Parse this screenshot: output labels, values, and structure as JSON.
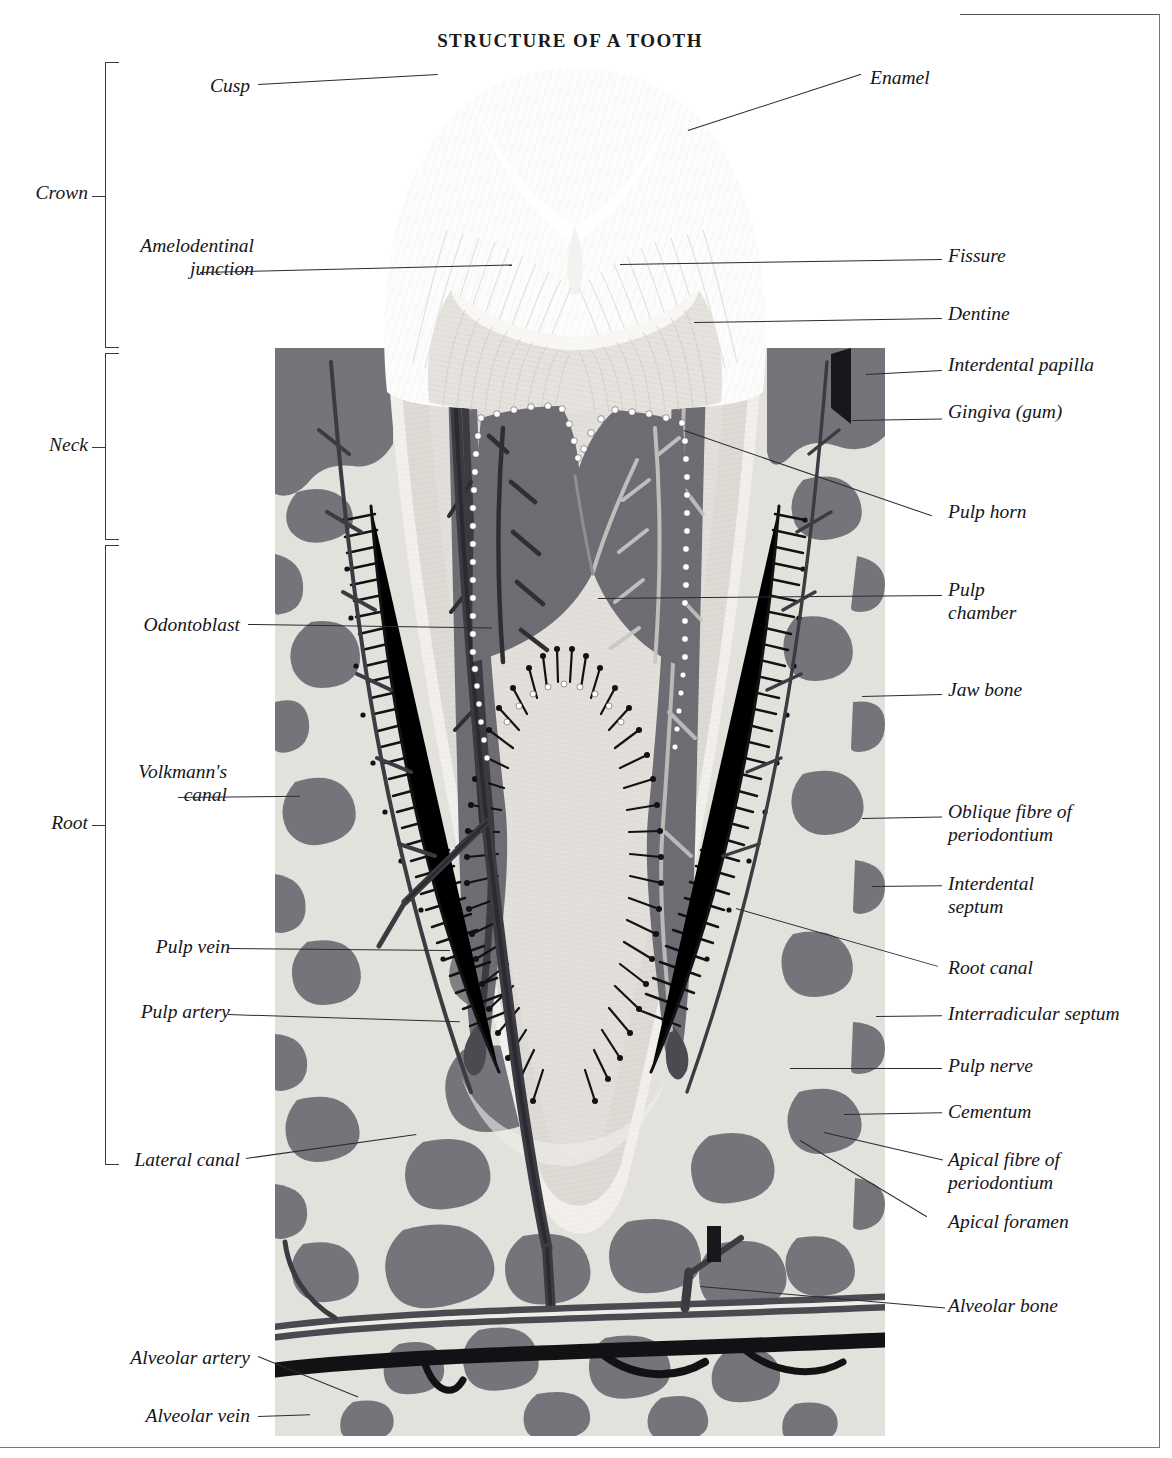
{
  "title": "STRUCTURE OF A TOOTH",
  "brackets": [
    {
      "name": "crown",
      "label": "Crown"
    },
    {
      "name": "neck",
      "label": "Neck"
    },
    {
      "name": "root",
      "label": "Root"
    }
  ],
  "labels_left": [
    {
      "name": "cusp",
      "text": "Cusp"
    },
    {
      "name": "amelodentinal-junction",
      "text": "Amelodentinal\njunction"
    },
    {
      "name": "odontoblast",
      "text": "Odontoblast"
    },
    {
      "name": "volkmanns-canal",
      "text": "Volkmann's\ncanal"
    },
    {
      "name": "pulp-vein",
      "text": "Pulp vein"
    },
    {
      "name": "pulp-artery",
      "text": "Pulp artery"
    },
    {
      "name": "lateral-canal",
      "text": "Lateral canal"
    },
    {
      "name": "alveolar-artery",
      "text": "Alveolar artery"
    },
    {
      "name": "alveolar-vein",
      "text": "Alveolar vein"
    }
  ],
  "labels_right": [
    {
      "name": "enamel",
      "text": "Enamel"
    },
    {
      "name": "fissure",
      "text": "Fissure"
    },
    {
      "name": "dentine",
      "text": "Dentine"
    },
    {
      "name": "interdental-papilla",
      "text": "Interdental papilla"
    },
    {
      "name": "gingiva",
      "text": "Gingiva (gum)"
    },
    {
      "name": "pulp-horn",
      "text": "Pulp horn"
    },
    {
      "name": "pulp-chamber",
      "text": "Pulp\nchamber"
    },
    {
      "name": "jaw-bone",
      "text": "Jaw bone"
    },
    {
      "name": "oblique-fibre",
      "text": "Oblique fibre of\nperiodontium"
    },
    {
      "name": "interdental-septum",
      "text": "Interdental\nseptum"
    },
    {
      "name": "root-canal",
      "text": "Root canal"
    },
    {
      "name": "interradicular-septum",
      "text": "Interradicular septum"
    },
    {
      "name": "pulp-nerve",
      "text": "Pulp nerve"
    },
    {
      "name": "cementum",
      "text": "Cementum"
    },
    {
      "name": "apical-fibre",
      "text": "Apical fibre of\nperiodontium"
    },
    {
      "name": "apical-foramen",
      "text": "Apical foramen"
    },
    {
      "name": "alveolar-bone",
      "text": "Alveolar bone"
    }
  ],
  "colors": {
    "enamel": "#fbfbfb",
    "dentine": "#dedbd6",
    "pulp": "#6d6d73",
    "gingiva": "#74747a",
    "bone_matrix": "#e4e2dd",
    "bone_marrow": "#74747a",
    "cementum": "#f4f2ee",
    "vessel_dark": "#3b3b41",
    "fibre": "#121214",
    "odontoblast": "#ffffff",
    "leader": "#2b2b31",
    "text": "#15151a"
  }
}
